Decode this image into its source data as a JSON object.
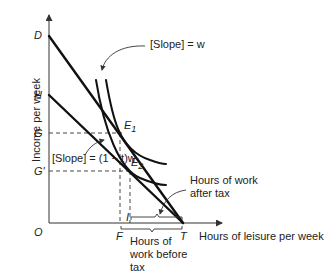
{
  "diagram": {
    "type": "labor-leisure budget constraint",
    "axes": {
      "y_label": "Income per week",
      "x_label": "Hours of leisure per week",
      "origin": "O"
    },
    "y_points": {
      "D": "D",
      "H": "H",
      "G": "G",
      "G_prime": "G'"
    },
    "x_points": {
      "F": "F",
      "I": "I",
      "T": "T"
    },
    "equilibria": {
      "E1_main": "E",
      "E1_sub": "1",
      "E2_main": "E",
      "E2_sub": "2"
    },
    "annotations": {
      "slope_w": "[Slope] = w",
      "slope_tax": "[Slope] = (1 − t)w",
      "after_tax_line1": "Hours of work",
      "after_tax_line2": "after tax",
      "before_tax_line1": "Hours of",
      "before_tax_line2": "work before",
      "before_tax_line3": "tax"
    }
  }
}
